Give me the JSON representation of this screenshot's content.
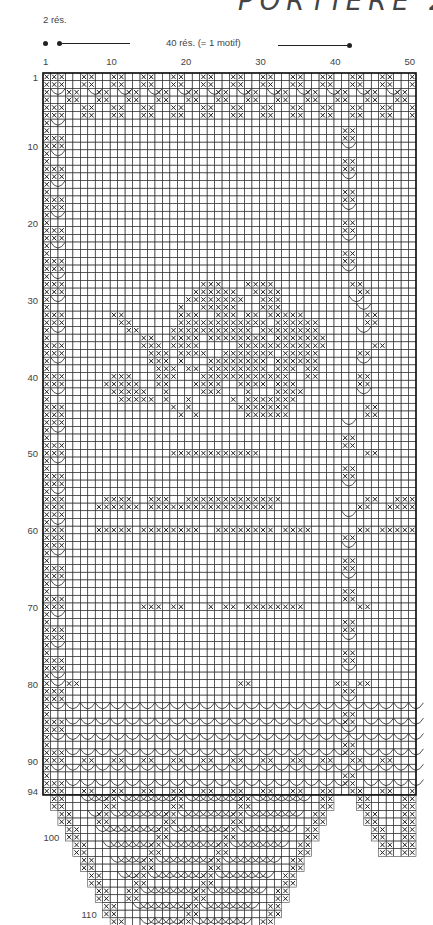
{
  "header": {
    "title_fragment": "PORTIÈRE 2",
    "small_repeat_label": "2 rés.",
    "motif_label": "40 rés. (= 1 motif)"
  },
  "chart_data": {
    "type": "filet-crochet-chart",
    "columns": 50,
    "rows": 112,
    "col_ticks": [
      1,
      10,
      20,
      30,
      40,
      50
    ],
    "row_ticks": [
      1,
      10,
      20,
      30,
      40,
      50,
      60,
      70,
      80,
      90,
      94,
      100,
      110,
      112
    ],
    "legend": {
      "two_mesh": "2 rés.",
      "motif_repeat": "40 rés. (= 1 motif)"
    },
    "symbols": {
      "filled_mesh": "X",
      "arch": "(",
      "empty_mesh": "."
    },
    "geometry": {
      "grid_left": 43,
      "grid_top": 73,
      "cell_w": 7.46,
      "cell_h": 7.68
    },
    "bottom_shape": {
      "main_point_start_row": 95,
      "main_point_cols_row94": [
        1,
        40
      ],
      "step_rows": 2,
      "step_cols": 1,
      "tip_cols_row112": [
        19,
        26
      ],
      "right_point_cols_row94": [
        41,
        50
      ],
      "right_point_tip_row": 102,
      "right_point_tip_cols": [
        48,
        50
      ]
    },
    "motif_rows": {
      "comment": "rows listed as 50-char strings; X=filled mesh, ( = arch start, . = empty",
      "1": "XXX..XX..XX..XX..XX..XX..XX..XX..XX..XX..XX..XX..X",
      "2": "XXX..XX..XX..XX..XX..XX..XX..XX..XX..XX..XX..XX..X",
      "3": "X(.XX.(XX.(XX.(XX.(XX.(XX.(XX.(XX.(XX.(XX.(XX.(XX.",
      "4": "X..XX..XX..XX..XX..XX..XX..XX..XX..XX..XX..XX..XX.",
      "5": "XXX..XX..XX..XX..XX..XX..XX..XX..XX..XX..XX..XX..X",
      "6": "XXX..XX..XX..XX..XX..XX..XX..XX..XX..XX..XX..XX..X",
      "28": "XXX..................XXX...XXXX..........XX.......",
      "29": "XXX.................XXXXXX..XXXX..........XX.......",
      "30": "X(.................XXXXXXXX..XXX.........(.........",
      "31": "X.................X..XXXXX...XXX..........(........",
      "32": "XXX......XX.......XXX..XXX.XX.XXXXX........XX......",
      "33": "XXX.......XX......XXXXXXXXXXXX.XXXXXX......XX......",
      "34": "X(.........XX....XXXXXXXXXXX.XXXXXXXX.....(........",
      "35": "X............XX..XXXX.XXXXXXXX.XXXXXXX.............",
      "36": "XXX..........XXX.XXXX.....XXXXXXXXXXXX......XX.....",
      "37": "XXX...........XXX.XXXX..XXXXXXX.XXXXX.....XX.......",
      "38": "X(............XXX.X...XXXXXXXX.XXXXXX.....(........",
      "39": "X..............XXX.XX.XXXXXXXX.XXX.XX..............",
      "40": "XXX......XXX...XXX...XXXXXXXXXXXX..XX.....XX.......",
      "41": "XXX.....XXXXX..XX...XXXX..XXXX.XXX........XX.......",
      "42": "X(.......XXXXX..X....XXX...X...XXXX.......(........",
      "43": "X.........XXXXX.X..X.....X.XXXXXXX.................",
      "44": "XXX..............X.X......XXXXXXX..........XX......",
      "45": "XXX...............X.X......XXXXXX..........XX......",
      "50": "XXX..............XXXXXXXXXXXX..............XX......",
      "56": "XXX.....XXXX..XXX..XXXXXXXXXXXXX...........XX..XXX.",
      "57": "XXX....XXXXXX.XXXXXXXXXXXXXXXXX...........XX..XXXXX",
      "60": "XXX....XXXXX.XXXXXXXX..XXXXXXXX.XXXX......XX.XXXXXX",
      "70": "XXX..........XXX.XX...X.XX.XXXXXXXX.......XX.......",
      "80": "X(.XX.....................XX...........XX.XX.......",
      "90": "XXX..XX..XX..XX..XX..XX..XX..XX..XX..XX..XX..XX....",
      "94": "XXX..XX..XX..XX..XX..XX..XX..XX..XX..XX..XX..XX..XX"
    }
  }
}
